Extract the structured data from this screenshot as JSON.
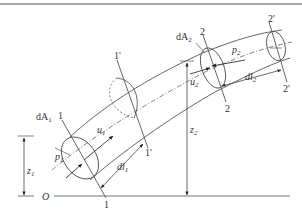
{
  "diagram": {
    "type": "streamtube-bernoulli-derivation",
    "colors": {
      "stroke": "#555555",
      "text": "#333333",
      "background": "#ffffff",
      "top_border": "#888888"
    },
    "labels": {
      "section1": "1",
      "section1_prime": "1'",
      "section2": "2",
      "section2_prime": "2'",
      "area1": "dA",
      "area1_sub": "1",
      "area2": "dA",
      "area2_sub": "2",
      "pressure1": "p",
      "pressure1_sub": "1",
      "pressure2": "p",
      "pressure2_sub": "2",
      "velocity1": "u",
      "velocity1_sub": "1",
      "velocity2": "u",
      "velocity2_sub": "2",
      "length1": "dl",
      "length1_sub": "1",
      "length2": "dl",
      "length2_sub": "2",
      "height1": "z",
      "height1_sub": "1",
      "height2": "z",
      "height2_sub": "2",
      "origin": "O"
    }
  }
}
